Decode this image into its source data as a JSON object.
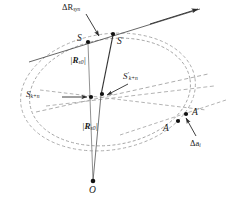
{
  "figure": {
    "type": "geometry-diagram",
    "background_color": "#ffffff",
    "line_color": "#3a3a3a",
    "dash_color": "#9a9a9a",
    "point_color": "#111111"
  },
  "labels": {
    "delta_r_syn": {
      "main": "ΔR",
      "sub": "syn"
    },
    "s": {
      "main": "S",
      "sub": "",
      "prime": ""
    },
    "s_prime": {
      "main": "S",
      "sub": "",
      "prime": "′"
    },
    "r_s0_upper": {
      "open": "|",
      "main": "R",
      "sub": "s0",
      "close": "|"
    },
    "r_s0_lower": {
      "open": "|",
      "main": "R",
      "sub": "s0",
      "close": "|"
    },
    "s_k_n": {
      "main": "S",
      "sub": "k+n",
      "prime": ""
    },
    "s_k_n_prime": {
      "main": "S",
      "sub": "k+n",
      "prime": "′"
    },
    "a": {
      "main": "A",
      "prime": ""
    },
    "a_prime": {
      "main": "A",
      "prime": "′"
    },
    "delta_a_i": {
      "main": "Δa",
      "sub": "i"
    },
    "o": {
      "main": "O"
    }
  },
  "points": [
    {
      "name": "S",
      "x": 88,
      "y": 42
    },
    {
      "name": "S-prime",
      "x": 113,
      "y": 34
    },
    {
      "name": "S-k-n",
      "x": 91,
      "y": 97
    },
    {
      "name": "S-k-n-prime",
      "x": 102,
      "y": 94
    },
    {
      "name": "A",
      "x": 178,
      "y": 120
    },
    {
      "name": "A-prime",
      "x": 185,
      "y": 114
    },
    {
      "name": "O",
      "x": 93,
      "y": 182
    }
  ],
  "ellipses": [
    {
      "name": "outer-ellipse",
      "cx": 108,
      "cy": 92,
      "rx": 88,
      "ry": 58,
      "rotation": -9,
      "style": "dashed"
    },
    {
      "name": "inner-ellipse",
      "cx": 110,
      "cy": 92,
      "rx": 81,
      "ry": 53,
      "rotation": -9,
      "style": "dashed"
    }
  ],
  "annotations": {
    "arrow_to_upper_right": true,
    "leader_delta_r_syn": true,
    "leader_s_k_n": true,
    "leader_s_k_n_prime": true,
    "leader_delta_a_i": true
  }
}
